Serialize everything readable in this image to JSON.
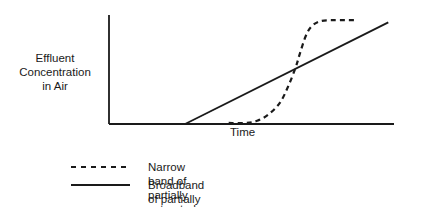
{
  "chart_data": {
    "type": "line",
    "title": "",
    "xlabel": "Time",
    "ylabel": "Effluent Concentration in Air",
    "ylabel_lines": [
      "Effluent",
      "Concentration",
      "in Air"
    ],
    "xlim": [
      0,
      1
    ],
    "ylim": [
      0,
      1
    ],
    "grid": false,
    "ticks": false,
    "legend_position": "bottom",
    "series": [
      {
        "name": "Narrow band of partially saturated charcoal (Line 1)",
        "legend_lines": [
          "Narrow band of partially saturated charcoal (Line 1)"
        ],
        "style": "dashed",
        "color": "#1a1a1a",
        "x": [
          0.42,
          0.48,
          0.52,
          0.56,
          0.6,
          0.63,
          0.655,
          0.67,
          0.69,
          0.71,
          0.74,
          0.78,
          0.83,
          0.87
        ],
        "y": [
          0.01,
          0.01,
          0.03,
          0.09,
          0.2,
          0.36,
          0.53,
          0.66,
          0.82,
          0.91,
          0.96,
          0.97,
          0.97,
          0.97
        ]
      },
      {
        "name": "Broadband of partially saturated charcoal with early breakthrough (Line 2)",
        "legend_lines": [
          "Broadband of partially saturated charcoal with",
          "early breakthrough (Line 2)"
        ],
        "style": "solid",
        "color": "#1a1a1a",
        "x": [
          0.267,
          0.98
        ],
        "y": [
          0.0,
          0.95
        ]
      }
    ]
  }
}
